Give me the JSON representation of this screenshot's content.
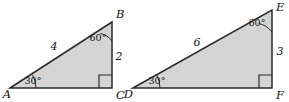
{
  "figure": {
    "name": "similar-right-triangles",
    "background_color": "#ffffff",
    "fill_color": "#d4d4d4",
    "stroke_color": "#2b2b2b",
    "label_color": "#141414",
    "width": 289,
    "height": 102
  },
  "triangles": [
    {
      "id": "triangle-abc",
      "name": "left-triangle",
      "vertices": [
        {
          "label": "A",
          "x": 10,
          "y": 88,
          "label_x": 7,
          "label_y": 94,
          "angle": "30"
        },
        {
          "label": "B",
          "x": 112,
          "y": 22,
          "label_x": 117,
          "label_y": 14,
          "angle": "60"
        },
        {
          "label": "C",
          "x": 112,
          "y": 88,
          "label_x": 117,
          "label_y": 95,
          "angle": "90"
        }
      ],
      "sides": [
        {
          "label": "4",
          "name": "hypotenuse-ab",
          "x": 54,
          "y": 47
        },
        {
          "label": "2",
          "name": "leg-bc",
          "x": 119,
          "y": 57
        }
      ],
      "angles": [
        {
          "label": "30°",
          "name": "angle-a",
          "x": 31,
          "y": 81
        },
        {
          "label": "60°",
          "name": "angle-b",
          "x": 97,
          "y": 38
        }
      ],
      "right_angle_vertex": "C"
    },
    {
      "id": "triangle-def",
      "name": "right-triangle",
      "vertices": [
        {
          "label": "D",
          "x": 133,
          "y": 88,
          "label_x": 130,
          "label_y": 95,
          "angle": "30"
        },
        {
          "label": "E",
          "x": 272,
          "y": 10,
          "label_x": 277,
          "label_y": 7,
          "angle": "60"
        },
        {
          "label": "F",
          "x": 272,
          "y": 88,
          "label_x": 277,
          "label_y": 95,
          "angle": "90"
        }
      ],
      "sides": [
        {
          "label": "6",
          "name": "hypotenuse-de",
          "x": 197,
          "y": 43
        },
        {
          "label": "3",
          "name": "leg-ef",
          "x": 279,
          "y": 52
        }
      ],
      "angles": [
        {
          "label": "30°",
          "name": "angle-d",
          "x": 155,
          "y": 81
        },
        {
          "label": "60°",
          "name": "angle-e",
          "x": 256,
          "y": 23
        }
      ],
      "right_angle_vertex": "F"
    }
  ]
}
